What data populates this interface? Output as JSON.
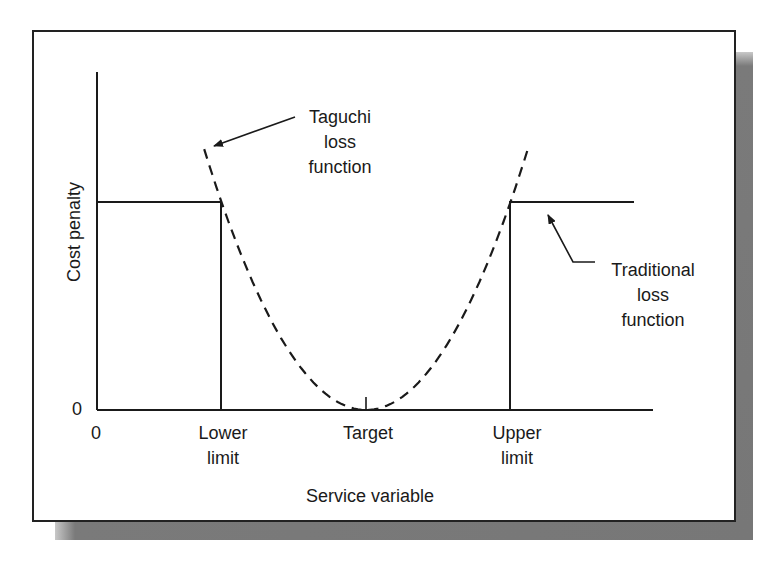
{
  "figure": {
    "y_axis_label": "Cost penalty",
    "x_axis_label": "Service variable",
    "y_zero_tick": "0",
    "x_zero_tick": "0",
    "x_ticks": {
      "lower_line1": "Lower",
      "lower_line2": "limit",
      "target": "Target",
      "upper_line1": "Upper",
      "upper_line2": "limit"
    },
    "annotations": {
      "taguchi_line1": "Taguchi",
      "taguchi_line2": "loss",
      "taguchi_line3": "function",
      "traditional_line1": "Traditional",
      "traditional_line2": "loss",
      "traditional_line3": "function"
    },
    "colors": {
      "line": "#1a1a1a",
      "frame": "#222222",
      "shadow": "#777777",
      "background": "#ffffff"
    }
  },
  "chart_data": {
    "type": "line",
    "title": "",
    "xlabel": "Service variable",
    "ylabel": "Cost penalty",
    "x_tick_labels": [
      "0",
      "Lower limit",
      "Target",
      "Upper limit"
    ],
    "y_tick_labels": [
      "0"
    ],
    "units_note": "schematic; x normalized so Target=0, Lower limit=-1, Upper limit=+1; y normalized so traditional penalty=1",
    "x_positions": {
      "origin": -2.0,
      "lower_limit": -1.0,
      "target": 0.0,
      "upper_limit": 1.0,
      "axis_end": 1.98
    },
    "series": [
      {
        "name": "Taguchi loss function",
        "style": "dashed",
        "form": "quadratic k*(x-target)^2, k=1",
        "x": [
          -1.12,
          -1.0,
          -0.75,
          -0.5,
          -0.25,
          0.0,
          0.25,
          0.5,
          0.75,
          1.0,
          1.12
        ],
        "values": [
          1.25,
          1.0,
          0.5625,
          0.25,
          0.0625,
          0.0,
          0.0625,
          0.25,
          0.5625,
          1.0,
          1.25
        ]
      },
      {
        "name": "Traditional loss function",
        "style": "solid step",
        "x": [
          -2.0,
          -1.0,
          -1.0,
          1.0,
          1.0,
          1.98
        ],
        "values": [
          1.0,
          1.0,
          0.0,
          0.0,
          1.0,
          1.0
        ]
      }
    ],
    "grid": false,
    "legend": "callout annotations with arrows"
  }
}
